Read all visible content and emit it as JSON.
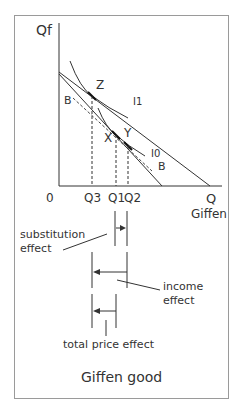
{
  "diagram": {
    "title": "Giffen good",
    "axes": {
      "y_label": "Qf",
      "x_label": "Q",
      "x_sublabel": "Giffen",
      "origin": "0",
      "ticks": [
        "Q3",
        "Q1",
        "Q2"
      ]
    },
    "points": [
      "Z",
      "X",
      "Y"
    ],
    "curves": {
      "indifference_high": "I1",
      "indifference_low": "I0",
      "compensated_budget_left": "B",
      "compensated_budget_right": "B"
    },
    "effects": {
      "substitution": [
        "substitution",
        "effect"
      ],
      "income": [
        "income",
        "effect"
      ],
      "total": "total price effect"
    },
    "colors": {
      "line": "#333333",
      "frame": "#9a9a9a",
      "text": "#333333"
    }
  }
}
